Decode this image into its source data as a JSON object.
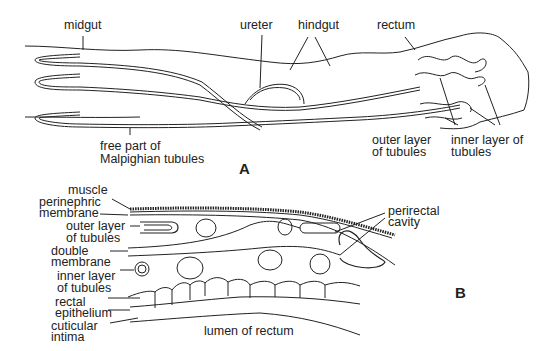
{
  "figure_a": {
    "panel_label": "A",
    "labels": {
      "midgut": "midgut",
      "ureter": "ureter",
      "hindgut": "hindgut",
      "rectum": "rectum",
      "free_part_line1": "free part of",
      "free_part_line2": "Malpighian tubules",
      "outer_layer_line1": "outer layer",
      "outer_layer_line2": "of tubules",
      "inner_layer_line1": "inner layer of",
      "inner_layer_line2": "tubules"
    }
  },
  "figure_b": {
    "panel_label": "B",
    "labels": {
      "muscle": "muscle",
      "perinephric_line1": "perinephric",
      "perinephric_line2": "membrane",
      "outer_layer_line1": "outer layer",
      "outer_layer_line2": "of tubules",
      "double_membrane_line1": "double",
      "double_membrane_line2": "membrane",
      "inner_layer_line1": "inner layer",
      "inner_layer_line2": "of tubules",
      "rectal_epithelium_line1": "rectal",
      "rectal_epithelium_line2": "epithelium",
      "cuticular_intima_line1": "cuticular",
      "cuticular_intima_line2": "intima",
      "perirectal_line1": "perirectal",
      "perirectal_line2": "cavity",
      "lumen": "lumen of rectum"
    }
  }
}
